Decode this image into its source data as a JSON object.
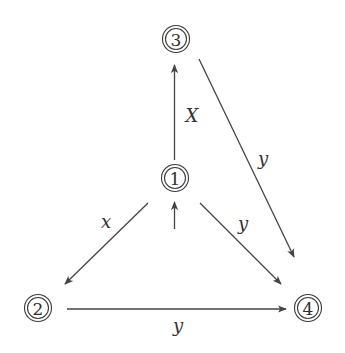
{
  "diagram": {
    "type": "state-transition-graph",
    "colors": {
      "stroke": "#444444",
      "text": "#333333",
      "background": "#ffffff"
    },
    "nodes": [
      {
        "id": "1",
        "label": "1",
        "accepting": true,
        "initial": true,
        "cx": 175,
        "cy": 178
      },
      {
        "id": "2",
        "label": "2",
        "accepting": true,
        "initial": false,
        "cx": 38,
        "cy": 308
      },
      {
        "id": "3",
        "label": "3",
        "accepting": true,
        "initial": false,
        "cx": 176,
        "cy": 39
      },
      {
        "id": "4",
        "label": "4",
        "accepting": true,
        "initial": false,
        "cx": 308,
        "cy": 308
      }
    ],
    "edges": [
      {
        "from": "1",
        "to": "3",
        "label": "X"
      },
      {
        "from": "1",
        "to": "2",
        "label": "x"
      },
      {
        "from": "1",
        "to": "4",
        "label": "y"
      },
      {
        "from": "3",
        "to": "4",
        "label": "y"
      },
      {
        "from": "2",
        "to": "4",
        "label": "y"
      }
    ],
    "initial_arrow": {
      "target": "1"
    }
  }
}
